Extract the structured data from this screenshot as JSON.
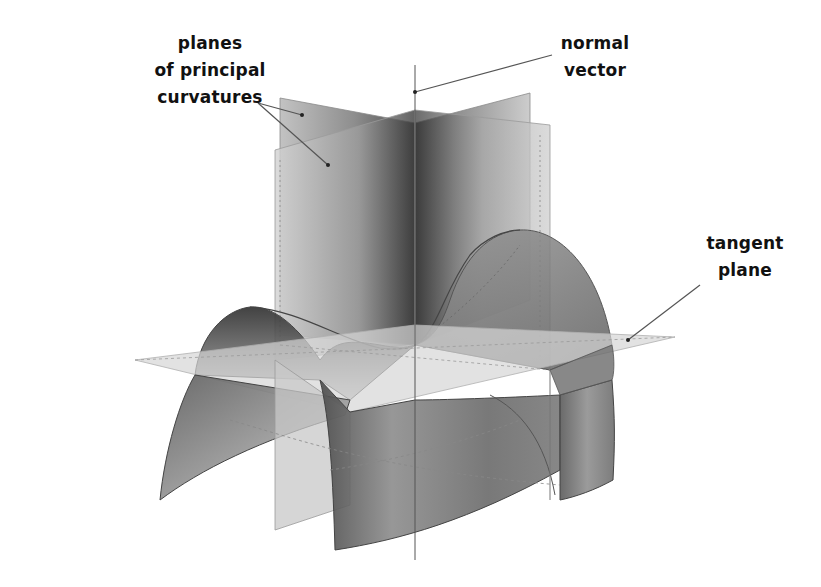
{
  "labels": {
    "planes": {
      "line1": "planes",
      "line2": "of principal",
      "line3": "curvatures"
    },
    "normal": {
      "line1": "normal",
      "line2": "vector"
    },
    "tangent": {
      "line1": "tangent",
      "line2": "plane"
    }
  },
  "colors": {
    "background": "#ffffff",
    "text": "#111111",
    "leader_line": "#555555",
    "surface_dark": "#2e2e2e",
    "surface_mid": "#8a8a8a",
    "surface_light": "#d0d0d0",
    "plane_fill": "#bdbdbd",
    "tangent_plane_fill": "#d6d6d6"
  },
  "elements": [
    "saddle surface",
    "two perpendicular planes of principal curvatures",
    "normal vector",
    "tangent plane"
  ]
}
